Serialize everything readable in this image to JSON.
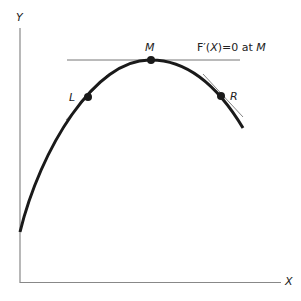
{
  "axes": {
    "y_label": "Y",
    "x_label": "X"
  },
  "points": {
    "left": "L",
    "max": "M",
    "right": "R"
  },
  "annotation": {
    "prefix": "F′(",
    "var": "X",
    "mid": ")=0 at ",
    "point": "M"
  },
  "colors": {
    "curve": "#1a1a1a",
    "axis": "#888888",
    "tangent": "#666666"
  }
}
